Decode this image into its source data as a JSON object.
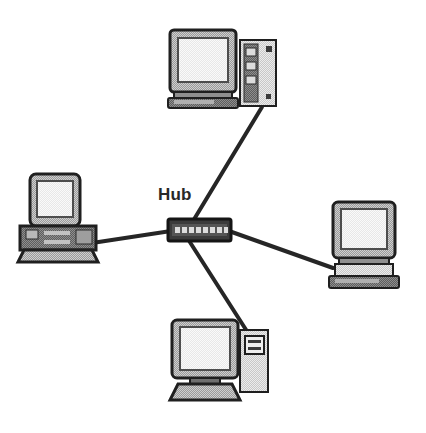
{
  "diagram": {
    "type": "star-topology-network-diagram",
    "background_color": "#ffffff",
    "canvas": {
      "width": 426,
      "height": 433
    },
    "labels": {
      "hub": "Hub"
    },
    "palette": {
      "outline": "#1a1a1a",
      "cable": "#262626",
      "device_dark": "#4a4a4a",
      "device_mid": "#8c8c8c",
      "device_light": "#b4b4b4",
      "screen_light": "#e2e2e2",
      "screen_highlight": "#f2f2f2",
      "hub_body": "#3b3b3b",
      "hub_port": "#d6d6d6",
      "text": "#282828"
    },
    "nodes": [
      {
        "id": "hub",
        "name": "Hub",
        "kind": "network-hub",
        "label": "Hub",
        "label_position": {
          "x": 158,
          "y": 186
        },
        "position": {
          "x": 168,
          "y": 219
        },
        "size": {
          "width": 63,
          "height": 22
        },
        "ports": 8
      },
      {
        "id": "workstation-top",
        "name": "Top workstation with tower server",
        "kind": "desktop-computer-with-tower",
        "position": {
          "x": 168,
          "y": 28
        },
        "size": {
          "width": 112,
          "height": 82
        },
        "has_tower": true,
        "tower_side": "right",
        "tower_bays": 3
      },
      {
        "id": "workstation-left",
        "name": "Left all-in-one computer",
        "kind": "all-in-one-computer",
        "position": {
          "x": 20,
          "y": 172
        },
        "size": {
          "width": 78,
          "height": 88
        },
        "has_tower": false
      },
      {
        "id": "workstation-right",
        "name": "Right desktop computer",
        "kind": "desktop-computer",
        "position": {
          "x": 327,
          "y": 200
        },
        "size": {
          "width": 76,
          "height": 90
        },
        "has_tower": false
      },
      {
        "id": "workstation-bottom",
        "name": "Bottom workstation with mini tower",
        "kind": "desktop-computer-with-tower",
        "position": {
          "x": 168,
          "y": 318
        },
        "size": {
          "width": 100,
          "height": 84
        },
        "has_tower": true,
        "tower_side": "right",
        "tower_bays": 2
      }
    ],
    "connections": [
      {
        "id": "link-hub-top",
        "from": "hub",
        "to": "workstation-top",
        "from_point": {
          "x": 190,
          "y": 226
        },
        "to_point": {
          "x": 262,
          "y": 107
        }
      },
      {
        "id": "link-hub-left",
        "from": "hub",
        "to": "workstation-left",
        "from_point": {
          "x": 169,
          "y": 231
        },
        "to_point": {
          "x": 92,
          "y": 243
        }
      },
      {
        "id": "link-hub-right",
        "from": "hub",
        "to": "workstation-right",
        "from_point": {
          "x": 231,
          "y": 231
        },
        "to_point": {
          "x": 331,
          "y": 268
        }
      },
      {
        "id": "link-hub-bottom",
        "from": "hub",
        "to": "workstation-bottom",
        "from_point": {
          "x": 186,
          "y": 238
        },
        "to_point": {
          "x": 249,
          "y": 334
        }
      }
    ]
  }
}
